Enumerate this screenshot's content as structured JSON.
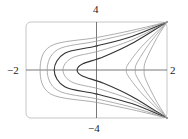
{
  "chart_data": {
    "type": "line",
    "title": "",
    "subtitle": "",
    "xlabel": "",
    "ylabel": "",
    "xlim": [
      -2,
      2
    ],
    "ylim": [
      -4,
      4
    ],
    "grid": false,
    "legend": null,
    "axis_tick_labels": {
      "x": [
        "-2",
        "2"
      ],
      "y": [
        "4",
        "-4"
      ]
    },
    "series": [
      {
        "name": "level-1 (innermost)",
        "points": [
          [
            2,
            4
          ],
          [
            1,
            2.2
          ],
          [
            0.2,
            1.1
          ],
          [
            -0.4,
            0.5
          ],
          [
            -0.55,
            0
          ],
          [
            -0.4,
            -0.5
          ],
          [
            0.2,
            -1.1
          ],
          [
            1,
            -2.2
          ],
          [
            2,
            -4
          ]
        ]
      },
      {
        "name": "level-2",
        "points": [
          [
            2,
            4
          ],
          [
            1,
            2.5
          ],
          [
            0.1,
            1.6
          ],
          [
            -0.7,
            1.0
          ],
          [
            -0.95,
            0
          ],
          [
            -0.7,
            -1.0
          ],
          [
            0.1,
            -1.6
          ],
          [
            1,
            -2.5
          ],
          [
            2,
            -4
          ]
        ]
      },
      {
        "name": "level-3",
        "points": [
          [
            2,
            4
          ],
          [
            1,
            2.8
          ],
          [
            0,
            2.0
          ],
          [
            -0.9,
            1.4
          ],
          [
            -1.2,
            0
          ],
          [
            -0.9,
            -1.4
          ],
          [
            0,
            -2.0
          ],
          [
            1,
            -2.8
          ],
          [
            2,
            -4
          ]
        ]
      },
      {
        "name": "level-4",
        "points": [
          [
            2,
            4
          ],
          [
            1,
            3.1
          ],
          [
            0,
            2.4
          ],
          [
            -1.1,
            1.7
          ],
          [
            -1.4,
            0
          ],
          [
            -1.1,
            -1.7
          ],
          [
            0,
            -2.4
          ],
          [
            1,
            -3.1
          ],
          [
            2,
            -4
          ]
        ]
      },
      {
        "name": "level-5 (outermost C)",
        "points": [
          [
            2,
            4
          ],
          [
            1,
            3.3
          ],
          [
            0,
            2.7
          ],
          [
            -1.3,
            2.0
          ],
          [
            -1.6,
            0
          ],
          [
            -1.3,
            -2.0
          ],
          [
            0,
            -2.7
          ],
          [
            1,
            -3.3
          ],
          [
            2,
            -4
          ]
        ]
      },
      {
        "name": "right-branch-1",
        "points": [
          [
            2,
            4
          ],
          [
            1.3,
            2.0
          ],
          [
            0.9,
            0.5
          ],
          [
            0.85,
            0
          ],
          [
            0.9,
            -0.5
          ],
          [
            1.3,
            -2.0
          ],
          [
            2,
            -4
          ]
        ]
      },
      {
        "name": "right-branch-2",
        "points": [
          [
            2,
            4
          ],
          [
            1.5,
            2.2
          ],
          [
            1.15,
            0.6
          ],
          [
            1.1,
            0
          ],
          [
            1.15,
            -0.6
          ],
          [
            1.5,
            -2.2
          ],
          [
            2,
            -4
          ]
        ]
      },
      {
        "name": "right-branch-3",
        "points": [
          [
            2,
            4
          ],
          [
            1.7,
            2.6
          ],
          [
            1.4,
            0.8
          ],
          [
            1.35,
            0
          ],
          [
            1.4,
            -0.8
          ],
          [
            1.7,
            -2.6
          ],
          [
            2,
            -4
          ]
        ]
      }
    ]
  },
  "labels": {
    "y_top": "4",
    "y_bottom": "−4",
    "x_left": "−2",
    "x_right": "2"
  },
  "colors": {
    "frame": "#b0b0b0",
    "axes": "#555555",
    "curve_dark": "#333333",
    "curve_light": "#999999"
  }
}
